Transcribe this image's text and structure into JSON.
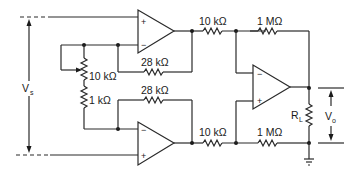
{
  "diagram": {
    "type": "circuit-schematic",
    "labels": {
      "input_voltage": "V",
      "input_voltage_sub": "s",
      "output_voltage": "V",
      "output_voltage_sub": "o",
      "load_resistor": "R",
      "load_resistor_sub": "L",
      "pot": "10 kΩ",
      "r_gain": "1 kΩ",
      "r_fb_top": "28 kΩ",
      "r_fb_bottom": "28 kΩ",
      "r_in_top": "10 kΩ",
      "r_in_bottom": "10 kΩ",
      "r_out_top": "1 MΩ",
      "r_out_bottom": "1 MΩ"
    },
    "opamps": [
      {
        "name": "top-input-opamp",
        "plus": "+",
        "minus": "−"
      },
      {
        "name": "bottom-input-opamp",
        "plus": "+",
        "minus": "−"
      },
      {
        "name": "output-opamp",
        "plus": "+",
        "minus": "−"
      }
    ],
    "colors": {
      "line": "#2a2a2a",
      "background": "#ffffff"
    }
  }
}
